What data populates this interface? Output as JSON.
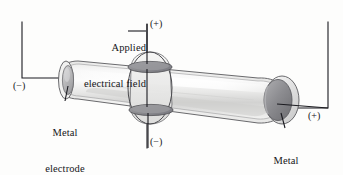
{
  "figure": {
    "background_color": "#fdfdfc",
    "line_color": "#1b1b20",
    "labels": {
      "applied_field_line1": "Applied",
      "applied_field_line2": "electrical field",
      "electrode_left_line1": "Metal",
      "electrode_left_line2": "electrode",
      "electrode_right_line1": "Metal",
      "electrode_right_line2": "electrode"
    },
    "polarity": {
      "top": "(+)",
      "bottom": "(−)",
      "left": "(−)",
      "right": "(+)"
    },
    "colors": {
      "electrode_fill": "#8d8d90",
      "electrode_fill_dark": "#77777b",
      "plate_fill": "#909094",
      "tube_glass_light": "#f4f4f3",
      "tube_glass_mid": "#d9d9d8",
      "tube_glass_shadow": "#bdbdbc",
      "outline": "#4a4a4e"
    },
    "components": {
      "tube": "tapered-glass-tube",
      "left_electrode": "small-disc-electrode",
      "right_electrode": "large-disc-electrode",
      "center_collar": "ring-collar-with-plates",
      "top_plate": "upper-field-plate",
      "bottom_plate": "lower-field-plate"
    }
  }
}
